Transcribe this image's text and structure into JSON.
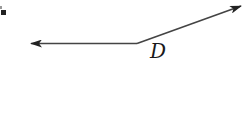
{
  "diagram": {
    "type": "angle",
    "vertex": {
      "label": "D",
      "x": 137,
      "y": 43
    },
    "rays": [
      {
        "name": "left-ray",
        "from": [
          137,
          43
        ],
        "to": [
          30,
          43
        ],
        "arrowhead": true
      },
      {
        "name": "upper-right-ray",
        "from": [
          137,
          43
        ],
        "to": [
          242,
          6
        ],
        "arrowhead": true
      }
    ],
    "stroke_color": "#333333",
    "label_color": "#1a1a1a"
  }
}
